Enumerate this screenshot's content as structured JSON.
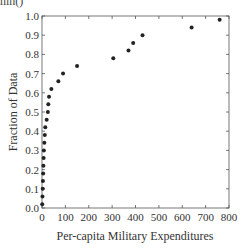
{
  "top_fragment": "nin()",
  "chart_data": {
    "type": "scatter",
    "title": "",
    "xlabel": "Per-capita Military Expenditures",
    "ylabel": "Fraction of Data",
    "xlim": [
      0,
      800
    ],
    "ylim": [
      0.0,
      1.0
    ],
    "xticks": [
      0,
      100,
      200,
      300,
      400,
      500,
      600,
      700,
      800
    ],
    "yticks": [
      0.0,
      0.1,
      0.2,
      0.3,
      0.4,
      0.5,
      0.6,
      0.7,
      0.8,
      0.9,
      1.0
    ],
    "ytick_labels": [
      "0.0",
      "0.1",
      "0.2",
      "0.3",
      "0.4",
      "0.5",
      "0.6",
      "0.7",
      "0.8",
      "0.9",
      "1.0"
    ],
    "grid": false,
    "legend": null,
    "marker_color": "#222222",
    "points": [
      {
        "x": 1,
        "y": 0.02
      },
      {
        "x": 2,
        "y": 0.06
      },
      {
        "x": 3,
        "y": 0.1
      },
      {
        "x": 4,
        "y": 0.14
      },
      {
        "x": 5,
        "y": 0.18
      },
      {
        "x": 6,
        "y": 0.22
      },
      {
        "x": 7,
        "y": 0.26
      },
      {
        "x": 8,
        "y": 0.3
      },
      {
        "x": 10,
        "y": 0.34
      },
      {
        "x": 12,
        "y": 0.38
      },
      {
        "x": 14,
        "y": 0.42
      },
      {
        "x": 20,
        "y": 0.46
      },
      {
        "x": 25,
        "y": 0.5
      },
      {
        "x": 27,
        "y": 0.54
      },
      {
        "x": 30,
        "y": 0.58
      },
      {
        "x": 40,
        "y": 0.62
      },
      {
        "x": 70,
        "y": 0.66
      },
      {
        "x": 90,
        "y": 0.7
      },
      {
        "x": 150,
        "y": 0.74
      },
      {
        "x": 305,
        "y": 0.78
      },
      {
        "x": 370,
        "y": 0.82
      },
      {
        "x": 390,
        "y": 0.86
      },
      {
        "x": 430,
        "y": 0.9
      },
      {
        "x": 640,
        "y": 0.94
      },
      {
        "x": 760,
        "y": 0.98
      }
    ]
  }
}
